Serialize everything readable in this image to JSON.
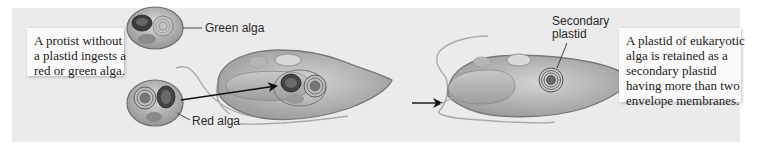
{
  "figure": {
    "step1_caption": {
      "lines": [
        "A protist without",
        "a plastid ingests a",
        "red or green alga."
      ]
    },
    "step2_caption": {
      "lines": [
        "A plastid of eukaryotic",
        "alga is retained as a",
        "secondary plastid",
        "having more than two",
        "envelope membranes."
      ]
    },
    "labels": {
      "green_alga": "Green alga",
      "red_alga": "Red alga",
      "secondary_plastid_line1": "Secondary",
      "secondary_plastid_line2": "plastid"
    },
    "colors": {
      "background_panel": "#ebebeb",
      "caption_box": "#fafafa",
      "arrow": "#111111"
    }
  }
}
